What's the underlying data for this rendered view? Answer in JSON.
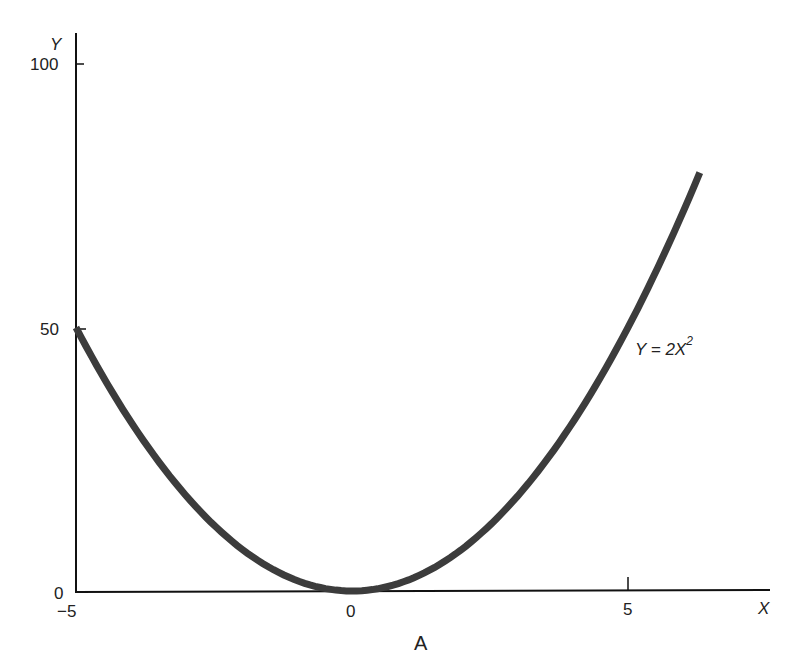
{
  "chart_data": {
    "type": "line",
    "title": "",
    "panel_label": "A",
    "xlabel": "X",
    "ylabel": "Y",
    "xlim": [
      -5,
      7.9
    ],
    "ylim": [
      0,
      106
    ],
    "x_ticks": [
      -5,
      0,
      5
    ],
    "x_tick_labels": [
      "−5",
      "0",
      "5"
    ],
    "y_ticks": [
      0,
      50,
      100
    ],
    "y_tick_labels": [
      "0",
      "50",
      "100"
    ],
    "grid": false,
    "legend": null,
    "series": [
      {
        "name": "Y = 2X²",
        "function": "Y = 2X^2",
        "x_range": [
          -5,
          6.3
        ],
        "x": [
          -5,
          -4,
          -3,
          -2,
          -1,
          0,
          1,
          2,
          3,
          4,
          5,
          6,
          6.3
        ],
        "y": [
          50,
          32,
          18,
          8,
          2,
          0,
          2,
          8,
          18,
          32,
          50,
          72,
          79.4
        ],
        "color": "#3c3c3c"
      }
    ],
    "annotations": [
      {
        "text": "Y = 2X²",
        "x": 6.0,
        "y": 47
      }
    ]
  },
  "labels": {
    "y_axis": "Y",
    "x_axis": "X",
    "y100": "100",
    "y50": "50",
    "y0": "0",
    "xm5": "−5",
    "x0": "0",
    "x5": "5",
    "panel": "A",
    "curve_lhs": "Y = 2X",
    "curve_exp": "2"
  }
}
